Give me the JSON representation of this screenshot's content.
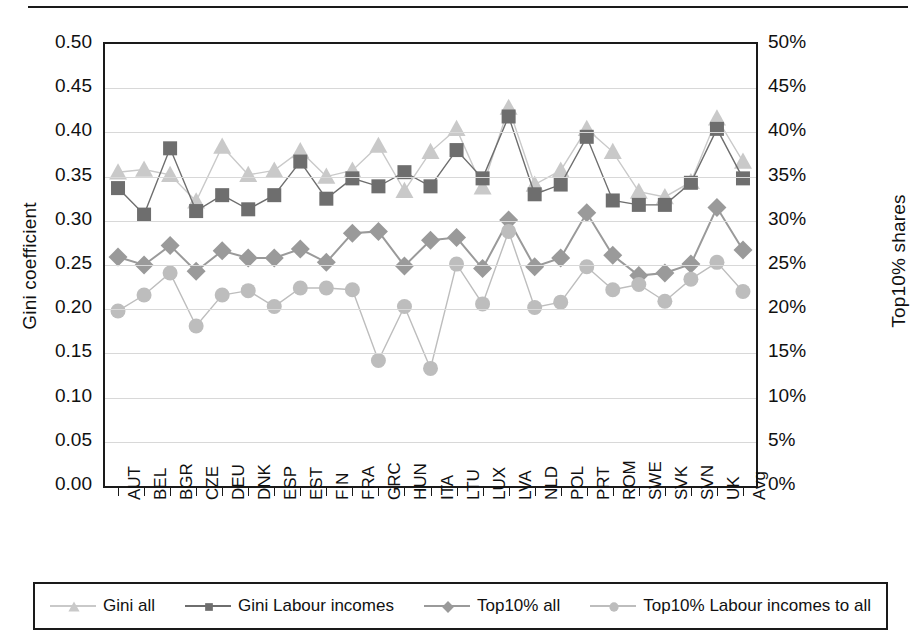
{
  "chart_data": {
    "type": "line",
    "title": "",
    "xlabel": "",
    "ylabel": "Gini coefficient",
    "ylabel_secondary": "Top10% shares",
    "ylim": [
      0.0,
      0.5
    ],
    "ylim_secondary": [
      0,
      50
    ],
    "yticks": [
      "0.00",
      "0.05",
      "0.10",
      "0.15",
      "0.20",
      "0.25",
      "0.30",
      "0.35",
      "0.40",
      "0.45",
      "0.50"
    ],
    "yticks_secondary": [
      "0%",
      "5%",
      "10%",
      "15%",
      "20%",
      "25%",
      "30%",
      "35%",
      "40%",
      "45%",
      "50%"
    ],
    "grid": true,
    "legend_position": "bottom",
    "categories": [
      "AUT",
      "BEL",
      "BGR",
      "CZE",
      "DEU",
      "DNK",
      "ESP",
      "EST",
      "FIN",
      "FRA",
      "GRC",
      "HUN",
      "ITA",
      "LTU",
      "LUX",
      "LVA",
      "NLD",
      "POL",
      "PRT",
      "ROM",
      "SWE",
      "SVK",
      "SVN",
      "UK",
      "Avg"
    ],
    "series": [
      {
        "name": "Gini all",
        "marker": "triangle",
        "color": "#c9c9c9",
        "axis": "left",
        "values": [
          0.355,
          0.358,
          0.352,
          0.322,
          0.384,
          0.352,
          0.357,
          0.379,
          0.35,
          0.357,
          0.385,
          0.334,
          0.378,
          0.404,
          0.338,
          0.428,
          0.341,
          0.357,
          0.404,
          0.378,
          0.333,
          0.327,
          0.344,
          0.416,
          0.367
        ]
      },
      {
        "name": "Gini Labour incomes",
        "marker": "square",
        "color": "#6e6e6e",
        "axis": "left",
        "values": [
          0.337,
          0.307,
          0.382,
          0.311,
          0.329,
          0.313,
          0.329,
          0.367,
          0.325,
          0.348,
          0.339,
          0.355,
          0.339,
          0.38,
          0.348,
          0.418,
          0.33,
          0.341,
          0.395,
          0.323,
          0.318,
          0.318,
          0.343,
          0.404,
          0.348
        ]
      },
      {
        "name": "Top10% all",
        "marker": "diamond",
        "color": "#9a9a9a",
        "axis": "left",
        "values": [
          0.259,
          0.25,
          0.272,
          0.243,
          0.266,
          0.258,
          0.258,
          0.268,
          0.253,
          0.286,
          0.288,
          0.249,
          0.278,
          0.281,
          0.246,
          0.301,
          0.248,
          0.258,
          0.309,
          0.261,
          0.238,
          0.241,
          0.251,
          0.315,
          0.267
        ]
      },
      {
        "name": "Top10% Labour incomes to all",
        "marker": "circle",
        "color": "#bdbdbd",
        "axis": "left",
        "values": [
          0.198,
          0.216,
          0.241,
          0.181,
          0.216,
          0.221,
          0.203,
          0.224,
          0.224,
          0.222,
          0.142,
          0.203,
          0.133,
          0.251,
          0.206,
          0.288,
          0.202,
          0.208,
          0.248,
          0.222,
          0.228,
          0.209,
          0.234,
          0.253,
          0.22
        ]
      }
    ]
  },
  "legend": {
    "items": [
      {
        "label": "Gini all"
      },
      {
        "label": "Gini Labour incomes"
      },
      {
        "label": "Top10% all"
      },
      {
        "label": "Top10% Labour incomes to all"
      }
    ]
  }
}
